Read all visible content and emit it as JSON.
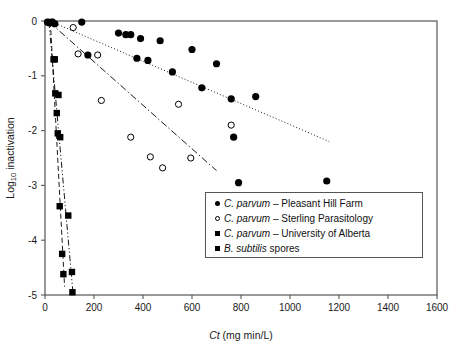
{
  "chart_data": {
    "type": "scatter",
    "title": "",
    "xlabel": "Ct (mg min/L)",
    "xlabel_italic_part": "Ct",
    "xlabel_rest": " (mg min/L)",
    "ylabel": "Log10 inactivation",
    "ylabel_base": "Log",
    "ylabel_sub": "10",
    "ylabel_tail": " inactivation",
    "xlim": [
      0,
      1600
    ],
    "ylim": [
      -5,
      0
    ],
    "xticks": [
      0,
      200,
      400,
      600,
      800,
      1000,
      1200,
      1400,
      1600
    ],
    "yticks": [
      0,
      -1,
      -2,
      -3,
      -4,
      -5
    ],
    "xtick_labels": [
      "0",
      "200",
      "400",
      "600",
      "800",
      "1000",
      "1200",
      "1400",
      "1600"
    ],
    "ytick_labels": [
      "0",
      "-1",
      "-2",
      "-3",
      "-4",
      "-5"
    ],
    "grid": false,
    "legend_position": "bottom-right",
    "series": [
      {
        "name": "C. parvum - Pleasant Hill Farm",
        "marker": "filled-circle",
        "color": "#000000",
        "points": [
          [
            10,
            -0.02
          ],
          [
            18,
            -0.03
          ],
          [
            30,
            -0.02
          ],
          [
            40,
            -0.05
          ],
          [
            150,
            -0.02
          ],
          [
            175,
            -0.62
          ],
          [
            300,
            -0.22
          ],
          [
            330,
            -0.25
          ],
          [
            350,
            -0.25
          ],
          [
            375,
            -0.68
          ],
          [
            390,
            -0.32
          ],
          [
            420,
            -0.72
          ],
          [
            470,
            -0.36
          ],
          [
            520,
            -0.93
          ],
          [
            600,
            -0.52
          ],
          [
            640,
            -1.22
          ],
          [
            700,
            -0.78
          ],
          [
            760,
            -1.42
          ],
          [
            770,
            -2.12
          ],
          [
            790,
            -2.95
          ],
          [
            860,
            -1.38
          ],
          [
            1150,
            -2.92
          ]
        ]
      },
      {
        "name": "C. parvum - Sterling Parasitology",
        "marker": "open-circle",
        "color": "#000000",
        "points": [
          [
            115,
            -0.12
          ],
          [
            135,
            -0.6
          ],
          [
            215,
            -0.62
          ],
          [
            230,
            -1.45
          ],
          [
            350,
            -2.12
          ],
          [
            430,
            -2.48
          ],
          [
            480,
            -2.68
          ],
          [
            545,
            -1.52
          ],
          [
            595,
            -2.5
          ],
          [
            760,
            -1.9
          ]
        ]
      },
      {
        "name": "C. parvum - University of Alberta",
        "marker": "filled-square",
        "color": "#000000",
        "points": [
          [
            25,
            -0.02
          ],
          [
            35,
            -0.7
          ],
          [
            42,
            -1.32
          ],
          [
            48,
            -1.68
          ],
          [
            52,
            -2.05
          ],
          [
            60,
            -3.38
          ],
          [
            70,
            -4.25
          ],
          [
            75,
            -4.62
          ]
        ]
      },
      {
        "name": "B. subtilis spores",
        "marker": "filled-square",
        "color": "#000000",
        "points": [
          [
            20,
            -0.02
          ],
          [
            40,
            -0.7
          ],
          [
            55,
            -1.35
          ],
          [
            62,
            -2.12
          ],
          [
            95,
            -3.55
          ],
          [
            110,
            -4.58
          ],
          [
            112,
            -4.95
          ]
        ]
      }
    ],
    "trendlines": [
      {
        "name": "dotted-trend-pleasant-hill",
        "style": "dotted",
        "x0": 30,
        "y0": -0.02,
        "x1": 1160,
        "y1": -2.2
      },
      {
        "name": "dashdot-trend-sterling",
        "style": "dash-dot",
        "x0": 18,
        "y0": -0.02,
        "x1": 700,
        "y1": -2.73
      },
      {
        "name": "dashed-trend-alberta",
        "style": "dashed",
        "x0": 22,
        "y0": -0.02,
        "x1": 80,
        "y1": -4.85
      },
      {
        "name": "dashdotdot-trend-subtilis",
        "style": "dash-dot-dot",
        "x0": 16,
        "y0": -0.02,
        "x1": 115,
        "y1": -5.0
      }
    ]
  },
  "legend": {
    "items": [
      {
        "marker": "filled-circle",
        "species": "C. parvum",
        "source": " – Pleasant Hill Farm"
      },
      {
        "marker": "open-circle",
        "species": "C. parvum",
        "source": " – Sterling Parasitology"
      },
      {
        "marker": "filled-square",
        "species": "C. parvum",
        "source": " – University of Alberta"
      },
      {
        "marker": "filled-square",
        "species": "B. subtilis",
        "source": " spores"
      }
    ]
  }
}
